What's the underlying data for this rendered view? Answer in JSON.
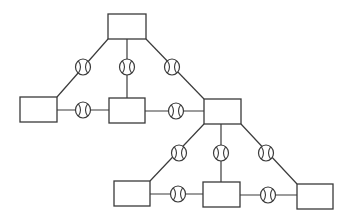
{
  "diagram": {
    "type": "network-of-boxes-connected-via-circle-symbols",
    "colors": {
      "stroke": "#3a3a3a",
      "background": "#ffffff"
    },
    "nodes": [
      {
        "id": "A",
        "label": "",
        "x": 108,
        "y": 14,
        "w": 38,
        "h": 25
      },
      {
        "id": "B",
        "label": "",
        "x": 20,
        "y": 97,
        "w": 37,
        "h": 25
      },
      {
        "id": "C",
        "label": "",
        "x": 109,
        "y": 98,
        "w": 36,
        "h": 25
      },
      {
        "id": "D",
        "label": "",
        "x": 204,
        "y": 99,
        "w": 37,
        "h": 25
      },
      {
        "id": "E",
        "label": "",
        "x": 114,
        "y": 181,
        "w": 36,
        "h": 25
      },
      {
        "id": "F",
        "label": "",
        "x": 203,
        "y": 182,
        "w": 37,
        "h": 25
      },
      {
        "id": "G",
        "label": "",
        "x": 297,
        "y": 184,
        "w": 36,
        "h": 25
      }
    ],
    "edges": [
      {
        "from": "A",
        "to": "B",
        "symbol": "circle-with-arcs",
        "x1": 108,
        "y1": 39,
        "x2": 57,
        "y2": 97,
        "cx": 83,
        "cy": 67
      },
      {
        "from": "A",
        "to": "C",
        "symbol": "circle-with-arcs",
        "x1": 127,
        "y1": 39,
        "x2": 127,
        "y2": 98,
        "cx": 127,
        "cy": 67
      },
      {
        "from": "A",
        "to": "D",
        "symbol": "circle-with-arcs",
        "x1": 146,
        "y1": 39,
        "x2": 204,
        "y2": 99,
        "cx": 172,
        "cy": 67
      },
      {
        "from": "B",
        "to": "C",
        "symbol": "circle-with-arcs",
        "x1": 57,
        "y1": 110,
        "x2": 109,
        "y2": 110,
        "cx": 83,
        "cy": 110
      },
      {
        "from": "C",
        "to": "D",
        "symbol": "circle-with-arcs",
        "x1": 145,
        "y1": 111,
        "x2": 204,
        "y2": 111,
        "cx": 176,
        "cy": 111
      },
      {
        "from": "D",
        "to": "E",
        "symbol": "circle-with-arcs",
        "x1": 204,
        "y1": 124,
        "x2": 150,
        "y2": 181,
        "cx": 179,
        "cy": 153
      },
      {
        "from": "D",
        "to": "F",
        "symbol": "circle-with-arcs",
        "x1": 221,
        "y1": 124,
        "x2": 221,
        "y2": 182,
        "cx": 221,
        "cy": 153
      },
      {
        "from": "D",
        "to": "G",
        "symbol": "circle-with-arcs",
        "x1": 241,
        "y1": 124,
        "x2": 297,
        "y2": 184,
        "cx": 266,
        "cy": 153
      },
      {
        "from": "E",
        "to": "F",
        "symbol": "circle-with-arcs",
        "x1": 150,
        "y1": 194,
        "x2": 203,
        "y2": 194,
        "cx": 178,
        "cy": 194
      },
      {
        "from": "F",
        "to": "G",
        "symbol": "circle-with-arcs",
        "x1": 240,
        "y1": 195,
        "x2": 297,
        "y2": 195,
        "cx": 268,
        "cy": 195
      }
    ],
    "symbol": {
      "name": "circle-with-arcs-icon",
      "rx": 7.5,
      "ry": 8
    }
  }
}
